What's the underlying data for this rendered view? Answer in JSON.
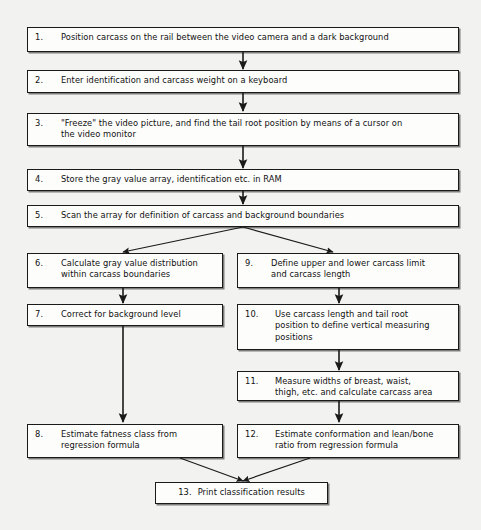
{
  "diagram": {
    "background_color": "#f2f2f0",
    "box_fill": "#fdfdfc",
    "line_color": "#1a1a1a",
    "steps": [
      {
        "id": "step-1",
        "number": "1.",
        "text": "Position carcass on the rail between the video camera and a dark background"
      },
      {
        "id": "step-2",
        "number": "2.",
        "text": "Enter identification and carcass weight on a keyboard"
      },
      {
        "id": "step-3",
        "number": "3.",
        "text": "\"Freeze\" the video picture, and find the tail root position by means of a cursor on\nthe video monitor"
      },
      {
        "id": "step-4",
        "number": "4.",
        "text": "Store the gray value array, identification etc. in RAM"
      },
      {
        "id": "step-5",
        "number": "5.",
        "text": "Scan the array for definition of carcass and background boundaries"
      },
      {
        "id": "step-6",
        "number": "6.",
        "text": "Calculate gray value distribution\nwithin carcass boundaries"
      },
      {
        "id": "step-7",
        "number": "7.",
        "text": "Correct for background level"
      },
      {
        "id": "step-8",
        "number": "8.",
        "text": "Estimate fatness class from\nregression formula"
      },
      {
        "id": "step-9",
        "number": "9.",
        "text": "Define upper and lower carcass limit\nand carcass length"
      },
      {
        "id": "step-10",
        "number": "10.",
        "text": "Use carcass length and tail root\nposition to define vertical measuring\npositions"
      },
      {
        "id": "step-11",
        "number": "11.",
        "text": "Measure widths of breast, waist,\nthigh, etc. and calculate carcass area"
      },
      {
        "id": "step-12",
        "number": "12.",
        "text": "Estimate conformation and lean/bone\nratio from regression formula"
      },
      {
        "id": "step-13",
        "number": "13.",
        "text": "Print classification results"
      }
    ]
  }
}
